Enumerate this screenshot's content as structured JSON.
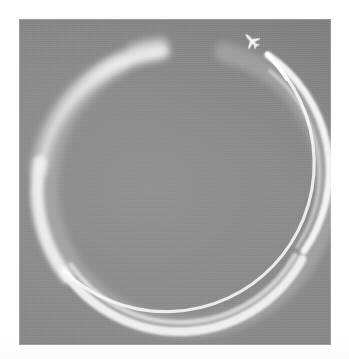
{
  "page": {
    "background_color": "#ffffff",
    "photo": {
      "title": "Airplane contrail circle in the sky",
      "left": 19,
      "top": 19,
      "width": 312,
      "height": 326,
      "sky_color": "#8b8b8b",
      "contrail_color": "#efefef",
      "aircraft_color": "#f7f7f7",
      "is_grayscale": true
    }
  },
  "scene": {
    "sky": {
      "label": "overcast gray sky",
      "color": "#8b8b8b",
      "highlight_color": "#949494",
      "shadow_color": "#828282"
    },
    "contrail": {
      "label": "circular contrail loop",
      "color": "#efefef",
      "core_color": "#fafafa",
      "center_x": 153,
      "center_y": 171,
      "radius": 140,
      "start_angle_deg": -68,
      "sweep_deg": 332,
      "stroke_width_thin": 5,
      "stroke_width_thick": 11,
      "is_double_trail": true,
      "double_trail_arc": "lower-right to bottom",
      "fade_end_angle_deg": -96,
      "notes": "loop nearly closed; the oldest end diffuses and fades out near the top, a small gap remains before the aircraft"
    },
    "aircraft": {
      "label": "jet airliner",
      "icon": "airplane-icon",
      "color": "#f7f7f7",
      "center_x": 231,
      "center_y": 20,
      "size_px": 14,
      "heading_deg": -42,
      "heading_label": "up-left",
      "position_note": "at the open end of the loop, climbing away from the contrail tip"
    }
  },
  "chart_data": null
}
